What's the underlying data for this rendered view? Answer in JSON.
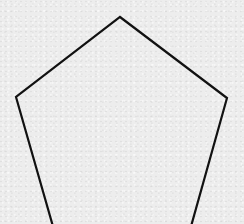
{
  "figure": {
    "shape": "pentagon",
    "stroke_color": "#111111",
    "stroke_width": 2.2,
    "fill": "none",
    "background_color": "#ededed",
    "vertices": [
      {
        "name": "top",
        "x": 120,
        "y": 17
      },
      {
        "name": "right",
        "x": 227,
        "y": 98
      },
      {
        "name": "bottom-right",
        "x": 190,
        "y": 230
      },
      {
        "name": "bottom-left",
        "x": 54,
        "y": 230
      },
      {
        "name": "left",
        "x": 16,
        "y": 97
      }
    ]
  }
}
